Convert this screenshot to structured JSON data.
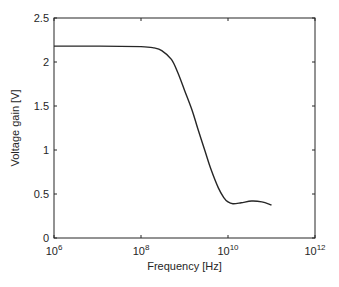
{
  "chart_data": {
    "type": "line",
    "title": "",
    "xlabel": "Frequency [Hz]",
    "ylabel": "Voltage gain [V]",
    "xscale": "log",
    "xlim": [
      1000000.0,
      1000000000000.0
    ],
    "ylim": [
      0,
      2.5
    ],
    "grid": false,
    "legend": null,
    "x_ticks": [
      {
        "base": "10",
        "exp": "6",
        "value": 1000000.0
      },
      {
        "base": "10",
        "exp": "8",
        "value": 100000000.0
      },
      {
        "base": "10",
        "exp": "10",
        "value": 10000000000.0
      },
      {
        "base": "10",
        "exp": "12",
        "value": 1000000000000.0
      }
    ],
    "y_ticks": [
      "0",
      "0.5",
      "1",
      "1.5",
      "2",
      "2.5"
    ],
    "series": [
      {
        "name": "Voltage gain",
        "color": "#262626",
        "x": [
          1000000.0,
          10000000.0,
          100000000.0,
          200000000.0,
          300000000.0,
          500000000.0,
          700000000.0,
          1000000000.0,
          1500000000.0,
          2000000000.0,
          3000000000.0,
          4000000000.0,
          6000000000.0,
          8000000000.0,
          10000000000.0,
          13000000000.0,
          20000000000.0,
          35000000000.0,
          60000000000.0,
          100000000000.0
        ],
        "y": [
          2.18,
          2.18,
          2.175,
          2.16,
          2.13,
          2.03,
          1.88,
          1.68,
          1.45,
          1.25,
          0.98,
          0.79,
          0.57,
          0.46,
          0.41,
          0.39,
          0.4,
          0.42,
          0.41,
          0.375
        ]
      }
    ]
  }
}
